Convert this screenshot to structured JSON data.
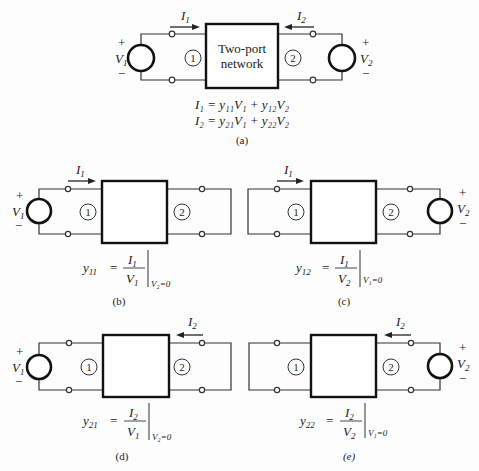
{
  "figure": {
    "panel_a": {
      "caption": "(a)",
      "box_label_line1": "Two-port",
      "box_label_line2": "network",
      "port1": "1",
      "port2": "2",
      "current1": "I",
      "current1_sub": "1",
      "current2": "I",
      "current2_sub": "2",
      "source1": "V",
      "source1_sub": "1",
      "source2": "V",
      "source2_sub": "2",
      "plus": "+",
      "minus": "−",
      "equation1": "I₁ = y₁₁V₁ + y₁₂V₂",
      "equation2": "I₂ = y₂₁V₁ + y₂₂V₂"
    },
    "panel_b": {
      "caption": "(b)",
      "param": "y",
      "param_sub": "11",
      "num": "I",
      "num_sub": "1",
      "den": "V",
      "den_sub": "1",
      "cond": "V₂=0",
      "port1": "1",
      "port2": "2"
    },
    "panel_c": {
      "caption": "(c)",
      "param": "y",
      "param_sub": "12",
      "num": "I",
      "num_sub": "1",
      "den": "V",
      "den_sub": "2",
      "cond": "V₁=0",
      "port1": "1",
      "port2": "2"
    },
    "panel_d": {
      "caption": "(d)",
      "param": "y",
      "param_sub": "21",
      "num": "I",
      "num_sub": "2",
      "den": "V",
      "den_sub": "1",
      "cond": "V₂=0",
      "port1": "1",
      "port2": "2"
    },
    "panel_e": {
      "caption": "(e)",
      "param": "y",
      "param_sub": "22",
      "num": "I",
      "num_sub": "2",
      "den": "V",
      "den_sub": "2",
      "cond": "V₁=0",
      "port1": "1",
      "port2": "2"
    },
    "equals": "="
  }
}
